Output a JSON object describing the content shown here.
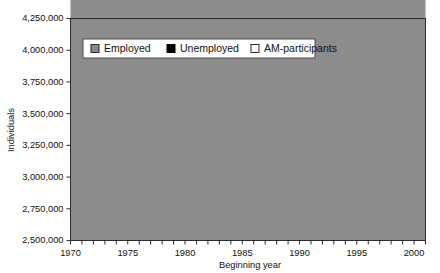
{
  "caption": {
    "ghost_text": "Figure  Development of the labour force, employed, unemployed and AM-participants"
  },
  "chart_data": {
    "type": "area",
    "stacked": true,
    "title": "",
    "subtitle": "",
    "xlabel": "Beginning year",
    "ylabel": "Individuals",
    "xlim": [
      1970,
      2001
    ],
    "ylim": [
      2500000,
      4250000
    ],
    "ytick_step": 250000,
    "xtick_step": 1,
    "xlabel_step": 5,
    "grid": false,
    "legend_position": "top-left-inside",
    "ytick_labels": [
      "2,500,000",
      "2,750,000",
      "3,000,000",
      "3,250,000",
      "3,500,000",
      "3,750,000",
      "4,000,000",
      "4,250,000"
    ],
    "ytick_values": [
      2500000,
      2750000,
      3000000,
      3250000,
      3500000,
      3750000,
      4000000,
      4250000
    ],
    "xtick_labels": [
      "1970",
      "1975",
      "1980",
      "1985",
      "1990",
      "1995",
      "2000"
    ],
    "xtick_values": [
      1970,
      1975,
      1980,
      1985,
      1990,
      1995,
      2000
    ],
    "x": [
      1970,
      1971,
      1972,
      1973,
      1974,
      1975,
      1976,
      1977,
      1978,
      1979,
      1980,
      1981,
      1982,
      1983,
      1984,
      1985,
      1986,
      1987,
      1988,
      1989,
      1990,
      1991,
      1992,
      1993,
      1994,
      1995,
      1996,
      1997,
      1998,
      1999,
      2000,
      2001
    ],
    "series": [
      {
        "name": "Employed",
        "color": "#8c8c8c",
        "values": [
          3140000,
          3185000,
          3225000,
          3258000,
          3268000,
          3175000,
          3060000,
          3000000,
          2975000,
          2978000,
          2995000,
          3020000,
          3055000,
          3080000,
          3085000,
          3130000,
          3195000,
          3265000,
          3330000,
          3395000,
          3470000,
          3560000,
          3640000,
          3600000,
          3640000,
          3665000,
          3700000,
          3725000,
          3760000,
          3800000,
          3840000,
          3870000
        ]
      },
      {
        "name": "Unemployed",
        "color": "#000000",
        "values": [
          0,
          0,
          0,
          0,
          0,
          10000,
          22000,
          28000,
          30000,
          30000,
          28000,
          28000,
          28000,
          30000,
          32000,
          32000,
          30000,
          28000,
          26000,
          26000,
          26000,
          32000,
          95000,
          170000,
          190000,
          200000,
          200000,
          195000,
          170000,
          130000,
          105000,
          90000
        ]
      },
      {
        "name": "AM-participants",
        "color": "#f7f7f7",
        "values": [
          0,
          0,
          0,
          0,
          0,
          0,
          0,
          0,
          0,
          0,
          0,
          0,
          0,
          0,
          0,
          0,
          0,
          0,
          0,
          0,
          0,
          0,
          5000,
          10000,
          35000,
          40000,
          38000,
          36000,
          34000,
          32000,
          34000,
          50000
        ]
      }
    ],
    "totals": [
      3140000,
      3185000,
      3225000,
      3258000,
      3268000,
      3185000,
      3082000,
      3028000,
      3005000,
      3008000,
      3023000,
      3048000,
      3083000,
      3110000,
      3117000,
      3162000,
      3225000,
      3293000,
      3356000,
      3421000,
      3496000,
      3592000,
      3740000,
      3780000,
      3865000,
      3905000,
      3938000,
      3956000,
      3964000,
      3962000,
      3979000,
      4010000
    ]
  },
  "legend": {
    "items": [
      {
        "label": "Employed",
        "marker": "filled-square-gray"
      },
      {
        "label": "Unemployed",
        "marker": "filled-square-black"
      },
      {
        "label": "AM-participants",
        "marker": "filled-square-white"
      }
    ]
  }
}
